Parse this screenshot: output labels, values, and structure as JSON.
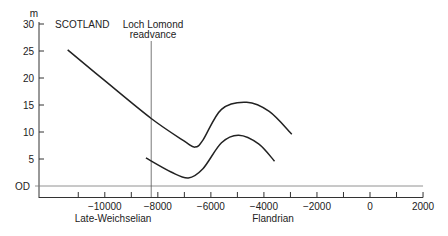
{
  "chart_data": {
    "type": "line",
    "title": "SCOTLAND",
    "ylabel": "m",
    "xlabel": "",
    "ylim": [
      -2,
      30
    ],
    "xlim": [
      -12000,
      2000
    ],
    "grid": false,
    "y_ticks": [
      "30",
      "25",
      "20",
      "15",
      "10",
      "5",
      "OD"
    ],
    "x_ticks": [
      "-10000",
      "-8000",
      "-6000",
      "-4000",
      "-2000",
      "0",
      "2000"
    ],
    "period_labels": [
      "Late-Weichselian",
      "Flandrian"
    ],
    "annotations": [
      {
        "text": "Loch Lomond readvance",
        "x": -8250
      }
    ],
    "series": [
      {
        "name": "upper limit",
        "x": [
          -11400,
          -10000,
          -8250,
          -7000,
          -6600,
          -6300,
          -5600,
          -4650,
          -3800,
          -2950
        ],
        "values": [
          25.2,
          19.5,
          12.5,
          8.3,
          7.2,
          8.5,
          14.2,
          15.5,
          13.8,
          9.6
        ]
      },
      {
        "name": "lower limit",
        "x": [
          -8450,
          -7500,
          -6850,
          -6300,
          -5600,
          -4950,
          -4200,
          -3600
        ],
        "values": [
          5.2,
          2.6,
          1.5,
          3.2,
          8.0,
          9.4,
          7.8,
          4.6
        ]
      }
    ]
  },
  "labels": {
    "unit": "m",
    "title": "SCOTLAND",
    "annotation_line1": "Loch Lomond",
    "annotation_line2": "readvance",
    "period_left": "Late-Weichselian",
    "period_right": "Flandrian"
  }
}
